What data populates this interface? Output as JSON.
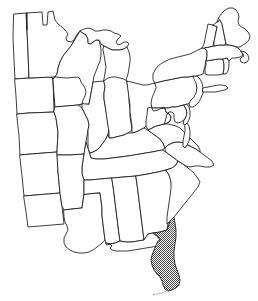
{
  "figure": {
    "caption": "",
    "background_color": "#ffffff",
    "outline_color": "#1a1a1a",
    "highlight_fill_color": "#9a9a9a",
    "highlight_pattern": "stipple-crosshatch",
    "default_fill_color": "#ffffff",
    "width_px": 258,
    "height_px": 301
  },
  "legend": {
    "highlighted_label": "Florida",
    "highlighted_state_code": "FL",
    "highlight_description": "shaded with stipple pattern"
  },
  "states": [
    {
      "code": "MN",
      "name": "Minnesota",
      "highlighted": false
    },
    {
      "code": "WI",
      "name": "Wisconsin",
      "highlighted": false
    },
    {
      "code": "MI",
      "name": "Michigan",
      "highlighted": false
    },
    {
      "code": "MI-UP",
      "name": "Michigan Upper Peninsula",
      "highlighted": false
    },
    {
      "code": "IA",
      "name": "Iowa",
      "highlighted": false
    },
    {
      "code": "IL",
      "name": "Illinois",
      "highlighted": false
    },
    {
      "code": "IN",
      "name": "Indiana",
      "highlighted": false
    },
    {
      "code": "OH",
      "name": "Ohio",
      "highlighted": false
    },
    {
      "code": "MO",
      "name": "Missouri",
      "highlighted": false
    },
    {
      "code": "KY",
      "name": "Kentucky",
      "highlighted": false
    },
    {
      "code": "TN",
      "name": "Tennessee",
      "highlighted": false
    },
    {
      "code": "AR",
      "name": "Arkansas",
      "highlighted": false
    },
    {
      "code": "LA",
      "name": "Louisiana",
      "highlighted": false
    },
    {
      "code": "MS",
      "name": "Mississippi",
      "highlighted": false
    },
    {
      "code": "AL",
      "name": "Alabama",
      "highlighted": false
    },
    {
      "code": "GA",
      "name": "Georgia",
      "highlighted": false
    },
    {
      "code": "FL",
      "name": "Florida",
      "highlighted": true
    },
    {
      "code": "SC",
      "name": "South Carolina",
      "highlighted": false
    },
    {
      "code": "NC",
      "name": "North Carolina",
      "highlighted": false
    },
    {
      "code": "VA",
      "name": "Virginia",
      "highlighted": false
    },
    {
      "code": "WV",
      "name": "West Virginia",
      "highlighted": false
    },
    {
      "code": "MD",
      "name": "Maryland",
      "highlighted": false
    },
    {
      "code": "DE",
      "name": "Delaware",
      "highlighted": false
    },
    {
      "code": "PA",
      "name": "Pennsylvania",
      "highlighted": false
    },
    {
      "code": "NJ",
      "name": "New Jersey",
      "highlighted": false
    },
    {
      "code": "NY",
      "name": "New York",
      "highlighted": false
    },
    {
      "code": "CT",
      "name": "Connecticut",
      "highlighted": false
    },
    {
      "code": "RI",
      "name": "Rhode Island",
      "highlighted": false
    },
    {
      "code": "MA",
      "name": "Massachusetts",
      "highlighted": false
    },
    {
      "code": "VT",
      "name": "Vermont",
      "highlighted": false
    },
    {
      "code": "NH",
      "name": "New Hampshire",
      "highlighted": false
    },
    {
      "code": "ME",
      "name": "Maine",
      "highlighted": false
    },
    {
      "code": "ND-SD-NE-KS",
      "name": "Western plains column",
      "highlighted": false
    }
  ]
}
